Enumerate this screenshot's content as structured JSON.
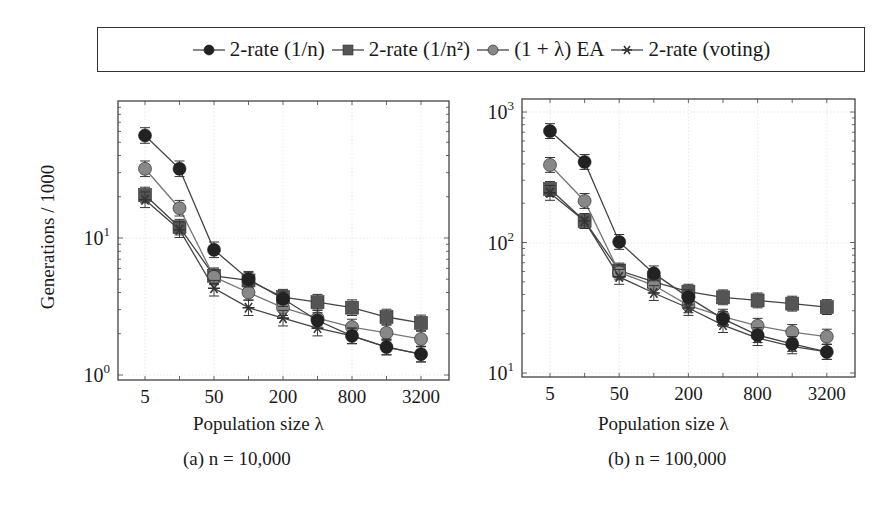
{
  "legend": {
    "entries": [
      {
        "label": "2-rate (1/n)",
        "marker": "circle",
        "color": "#222222"
      },
      {
        "label": "2-rate (1/n²)",
        "marker": "square",
        "color": "#555555"
      },
      {
        "label": "(1 + λ) EA",
        "marker": "circle",
        "color": "#888888"
      },
      {
        "label": "2-rate (voting)",
        "marker": "star",
        "color": "#333333"
      }
    ]
  },
  "panels": [
    {
      "caption": "(a) n = 10,000",
      "xlabel": "Population size λ",
      "ylabel": "Generations / 1000"
    },
    {
      "caption": "(b) n = 100,000",
      "xlabel": "Population size λ",
      "ylabel": ""
    }
  ],
  "chart_data": [
    {
      "type": "line",
      "title": "(a) n = 10,000",
      "xlabel": "Population size λ",
      "ylabel": "Generations / 1000",
      "yscale": "log",
      "ylim": [
        1,
        100
      ],
      "yticks": [
        "10^0",
        "10^1"
      ],
      "xticks": [
        "5",
        "50",
        "200",
        "800",
        "3200"
      ],
      "categories": [
        "5",
        "",
        "50",
        "",
        "200",
        "",
        "800",
        "",
        "3200"
      ],
      "grid": true,
      "legend_position": "top, outside",
      "series": [
        {
          "name": "2-rate (1/n)",
          "marker": "circle",
          "color": "#222222",
          "values": [
            56,
            32,
            8.2,
            5.0,
            3.6,
            2.5,
            1.93,
            1.6,
            1.42
          ]
        },
        {
          "name": "2-rate (1/n²)",
          "marker": "square",
          "color": "#555555",
          "values": [
            20.6,
            12,
            5.3,
            4.9,
            3.7,
            3.4,
            3.1,
            2.65,
            2.4
          ]
        },
        {
          "name": "(1 + λ) EA",
          "marker": "circle",
          "color": "#888888",
          "values": [
            32,
            16.5,
            5.2,
            4.0,
            3.1,
            2.6,
            2.24,
            2.03,
            1.83
          ]
        },
        {
          "name": "2-rate (voting)",
          "marker": "star",
          "color": "#333333",
          "values": [
            19,
            11.5,
            4.3,
            3.1,
            2.6,
            2.2,
            1.93,
            1.6,
            1.42
          ]
        }
      ]
    },
    {
      "type": "line",
      "title": "(b) n = 100,000",
      "xlabel": "Population size λ",
      "ylabel": "",
      "yscale": "log",
      "ylim": [
        9.5,
        1300
      ],
      "yticks": [
        "10^1",
        "10^2",
        "10^3"
      ],
      "xticks": [
        "5",
        "50",
        "200",
        "800",
        "3200"
      ],
      "categories": [
        "5",
        "",
        "50",
        "",
        "200",
        "",
        "800",
        "",
        "3200"
      ],
      "grid": true,
      "legend_position": "top, outside",
      "series": [
        {
          "name": "2-rate (1/n)",
          "marker": "circle",
          "color": "#222222",
          "values": [
            714,
            414,
            101,
            58,
            38,
            26,
            19.5,
            16.7,
            14.5
          ]
        },
        {
          "name": "2-rate (1/n²)",
          "marker": "square",
          "color": "#555555",
          "values": [
            257,
            146,
            61,
            50,
            42,
            38,
            36,
            34,
            32
          ]
        },
        {
          "name": "(1 + λ) EA",
          "marker": "circle",
          "color": "#888888",
          "values": [
            393,
            208,
            59,
            47,
            33,
            27,
            23,
            20.6,
            19
          ]
        },
        {
          "name": "2-rate (voting)",
          "marker": "star",
          "color": "#333333",
          "values": [
            240,
            146,
            54.5,
            41,
            31.5,
            23.3,
            18.5,
            16,
            14.5
          ]
        }
      ]
    }
  ]
}
